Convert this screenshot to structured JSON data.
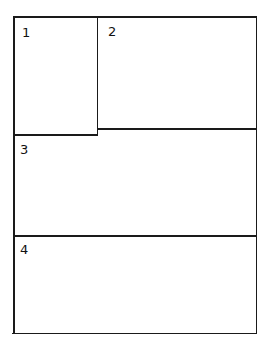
{
  "diagram": {
    "regions": [
      {
        "id": "region-1",
        "label": "1"
      },
      {
        "id": "region-2",
        "label": "2"
      },
      {
        "id": "region-3",
        "label": "3"
      },
      {
        "id": "region-4",
        "label": "4"
      }
    ],
    "line_color": "#1a1a1a"
  }
}
